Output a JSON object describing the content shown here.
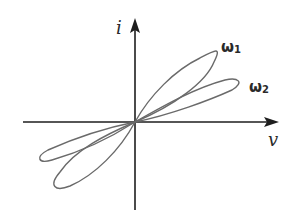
{
  "figure": {
    "type": "pinched-hysteresis-loop",
    "axes": {
      "x_label": "v",
      "y_label": "i"
    },
    "curves": [
      {
        "id": "omega1",
        "label_main": "ω",
        "label_sub": "1"
      },
      {
        "id": "omega2",
        "label_main": "ω",
        "label_sub": "2"
      }
    ],
    "colors": {
      "axis": "#1e1e1e",
      "curve": "#6a6a6a",
      "text": "#2a2a2a"
    }
  }
}
